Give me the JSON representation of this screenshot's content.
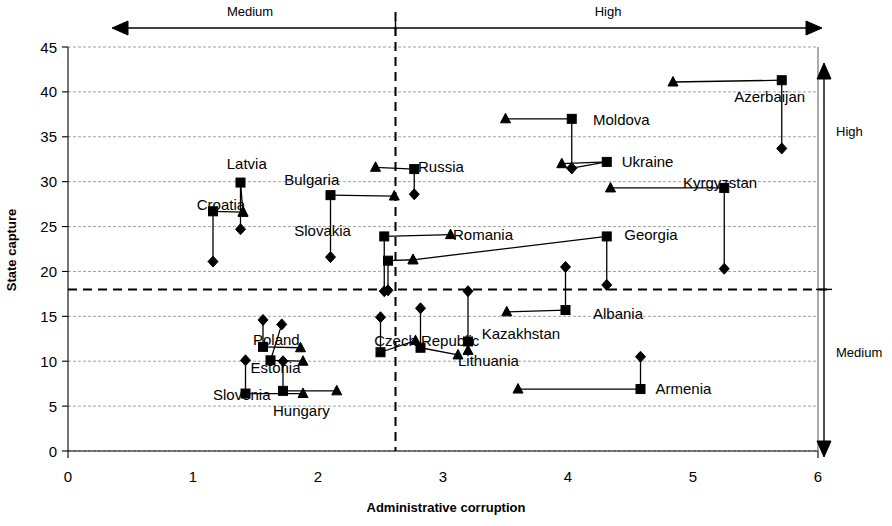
{
  "chart_data": {
    "type": "scatter",
    "title": "",
    "xlabel": "Administrative corruption",
    "ylabel": "State capture",
    "xlim": [
      0,
      6
    ],
    "ylim": [
      0,
      45
    ],
    "xticks": [
      "0",
      "1",
      "2",
      "3",
      "4",
      "5",
      "6"
    ],
    "yticks": [
      "0",
      "5",
      "10",
      "15",
      "20",
      "25",
      "30",
      "35",
      "40",
      "45"
    ],
    "grid": true,
    "legend": "none",
    "annotations": {
      "top_axis_left_label": "Medium",
      "top_axis_right_label": "High",
      "right_axis_top_label": "High",
      "right_axis_bottom_label": "Medium",
      "x_threshold": 2.62,
      "y_threshold": 18
    },
    "marker_types": [
      "square",
      "triangle",
      "diamond"
    ],
    "countries": [
      {
        "name": "Croatia",
        "label_x": 1.03,
        "label_y": 27.4,
        "square_x": 1.16,
        "square_y": 26.7,
        "triangle_x": 1.4,
        "triangle_y": 26.6,
        "diamond_x": 1.16,
        "diamond_y": 21.1
      },
      {
        "name": "Latvia",
        "label_x": 1.27,
        "label_y": 32.0,
        "square_x": 1.38,
        "square_y": 29.9,
        "triangle_x": 1.4,
        "triangle_y": 26.6,
        "diamond_x": 1.38,
        "diamond_y": 24.7
      },
      {
        "name": "Bulgaria",
        "label_x": 1.73,
        "label_y": 30.2,
        "square_x": 2.1,
        "square_y": 28.5,
        "triangle_x": 2.61,
        "triangle_y": 28.4,
        "diamond_x": 2.1,
        "diamond_y": 21.6
      },
      {
        "name": "Slovakia",
        "label_x": 1.81,
        "label_y": 24.5,
        "square_x": 2.53,
        "square_y": 23.9,
        "triangle_x": 3.06,
        "triangle_y": 24.1,
        "diamond_x": 2.53,
        "diamond_y": 17.8
      },
      {
        "name": "Russia",
        "label_x": 2.8,
        "label_y": 31.6,
        "square_x": 2.77,
        "square_y": 31.4,
        "triangle_x": 2.46,
        "triangle_y": 31.6,
        "diamond_x": 2.77,
        "diamond_y": 28.6
      },
      {
        "name": "Romania",
        "label_x": 3.08,
        "label_y": 24.1,
        "square_x": 2.56,
        "square_y": 21.2,
        "triangle_x": 2.76,
        "triangle_y": 21.3,
        "diamond_x": 2.56,
        "diamond_y": 17.9
      },
      {
        "name": "Moldova",
        "label_x": 4.2,
        "label_y": 36.9,
        "square_x": 4.03,
        "square_y": 37.0,
        "triangle_x": 3.5,
        "triangle_y": 37.0,
        "diamond_x": 4.03,
        "diamond_y": 31.5
      },
      {
        "name": "Azerbaijan",
        "label_x": 5.33,
        "label_y": 39.4,
        "square_x": 5.71,
        "square_y": 41.3,
        "triangle_x": 4.84,
        "triangle_y": 41.1,
        "diamond_x": 5.71,
        "diamond_y": 33.7
      },
      {
        "name": "Ukraine",
        "label_x": 4.43,
        "label_y": 32.2,
        "square_x": 4.31,
        "square_y": 32.2,
        "triangle_x": 3.95,
        "triangle_y": 32.0,
        "diamond_x": 4.03,
        "diamond_y": 31.5
      },
      {
        "name": "Kyrgyzstan",
        "label_x": 4.92,
        "label_y": 29.8,
        "square_x": 5.25,
        "square_y": 29.3,
        "triangle_x": 4.34,
        "triangle_y": 29.3,
        "diamond_x": 5.25,
        "diamond_y": 20.3
      },
      {
        "name": "Georgia",
        "label_x": 4.45,
        "label_y": 24.1,
        "square_x": 4.31,
        "square_y": 23.9,
        "triangle_x": 2.76,
        "triangle_y": 21.3,
        "diamond_x": 4.31,
        "diamond_y": 18.5
      },
      {
        "name": "Albania",
        "label_x": 4.2,
        "label_y": 15.3,
        "square_x": 3.98,
        "square_y": 15.7,
        "triangle_x": 3.51,
        "triangle_y": 15.5,
        "diamond_x": 3.98,
        "diamond_y": 20.5
      },
      {
        "name": "Kazakhstan",
        "label_x": 3.31,
        "label_y": 13.0,
        "square_x": 3.2,
        "square_y": 12.2,
        "triangle_x": 3.2,
        "triangle_y": 11.2,
        "diamond_x": 3.2,
        "diamond_y": 17.8
      },
      {
        "name": "Lithuania",
        "label_x": 3.12,
        "label_y": 10.0,
        "square_x": 2.82,
        "square_y": 11.5,
        "triangle_x": 3.12,
        "triangle_y": 10.7,
        "diamond_x": 2.82,
        "diamond_y": 15.9
      },
      {
        "name": "Czech Republic",
        "label_x": 2.45,
        "label_y": 12.2,
        "square_x": 2.5,
        "square_y": 11.0,
        "triangle_x": 2.78,
        "triangle_y": 12.3,
        "diamond_x": 2.5,
        "diamond_y": 14.9
      },
      {
        "name": "Poland",
        "label_x": 1.48,
        "label_y": 12.4,
        "square_x": 1.56,
        "square_y": 11.6,
        "triangle_x": 1.86,
        "triangle_y": 11.5,
        "diamond_x": 1.56,
        "diamond_y": 14.6
      },
      {
        "name": "Estonia",
        "label_x": 1.46,
        "label_y": 9.3,
        "square_x": 1.62,
        "square_y": 10.1,
        "triangle_x": 1.88,
        "triangle_y": 10.0,
        "diamond_x": 1.71,
        "diamond_y": 14.1
      },
      {
        "name": "Slovenia",
        "label_x": 1.16,
        "label_y": 6.2,
        "square_x": 1.42,
        "square_y": 6.4,
        "triangle_x": 1.88,
        "triangle_y": 6.4,
        "diamond_x": 1.42,
        "diamond_y": 10.1
      },
      {
        "name": "Hungary",
        "label_x": 1.64,
        "label_y": 4.4,
        "square_x": 1.72,
        "square_y": 6.7,
        "triangle_x": 2.15,
        "triangle_y": 6.7,
        "diamond_x": 1.72,
        "diamond_y": 10.0
      },
      {
        "name": "Armenia",
        "label_x": 4.7,
        "label_y": 6.9,
        "square_x": 4.58,
        "square_y": 6.9,
        "triangle_x": 3.6,
        "triangle_y": 6.9,
        "diamond_x": 4.58,
        "diamond_y": 10.5
      }
    ]
  }
}
